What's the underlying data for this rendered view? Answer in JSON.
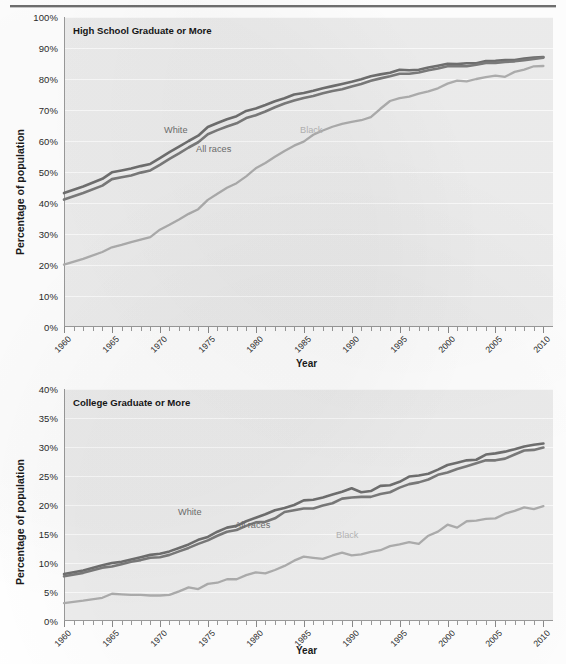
{
  "figure": {
    "shared_xlabel": "Year",
    "shared_ylabel": "Percentage of population"
  },
  "chart_data": [
    {
      "type": "line",
      "title": "High School Graduate or More",
      "xlabel": "Year",
      "ylabel": "Percentage of population",
      "xlim": [
        1960,
        2011
      ],
      "ylim": [
        0,
        100
      ],
      "ytick_labels": [
        "0%",
        "10%",
        "20%",
        "30%",
        "40%",
        "50%",
        "60%",
        "70%",
        "80%",
        "90%",
        "100%"
      ],
      "ytick_values": [
        0,
        10,
        20,
        30,
        40,
        50,
        60,
        70,
        80,
        90,
        100
      ],
      "xtick_labels": [
        "1960",
        "1965",
        "1970",
        "1975",
        "1980",
        "1985",
        "1990",
        "1995",
        "2000",
        "2005",
        "2010"
      ],
      "xtick_values": [
        1960,
        1965,
        1970,
        1975,
        1980,
        1985,
        1990,
        1995,
        2000,
        2005,
        2010
      ],
      "grid": "horizontal",
      "legend": "inline-annotations",
      "annotations": [
        {
          "text": "White",
          "series": "White"
        },
        {
          "text": "All races",
          "series": "All races"
        },
        {
          "text": "Black",
          "series": "Black"
        }
      ],
      "x": [
        1960,
        1962,
        1964,
        1965,
        1966,
        1967,
        1968,
        1969,
        1970,
        1971,
        1972,
        1973,
        1974,
        1975,
        1976,
        1977,
        1978,
        1979,
        1980,
        1981,
        1982,
        1983,
        1984,
        1985,
        1986,
        1987,
        1988,
        1989,
        1990,
        1991,
        1992,
        1993,
        1994,
        1995,
        1996,
        1997,
        1998,
        1999,
        2000,
        2001,
        2002,
        2003,
        2004,
        2005,
        2006,
        2007,
        2008,
        2009,
        2010
      ],
      "series": [
        {
          "name": "White",
          "color": "#6f6f6f",
          "values": [
            43.2,
            45.3,
            47.8,
            49.9,
            50.5,
            51.1,
            51.9,
            52.6,
            54.5,
            56.4,
            58.2,
            60.0,
            61.7,
            64.5,
            65.8,
            67.0,
            68.0,
            69.7,
            70.5,
            71.6,
            72.8,
            73.8,
            75.0,
            75.5,
            76.2,
            77.0,
            77.7,
            78.4,
            79.1,
            79.9,
            80.9,
            81.5,
            82.0,
            83.0,
            82.8,
            83.0,
            83.7,
            84.3,
            84.9,
            84.8,
            85.1,
            85.1,
            85.8,
            85.9,
            86.1,
            86.1,
            86.6,
            86.9,
            87.1
          ]
        },
        {
          "name": "All races",
          "color": "#7a7a7a",
          "values": [
            41.1,
            43.2,
            45.6,
            47.7,
            48.3,
            48.9,
            49.8,
            50.5,
            52.3,
            54.2,
            56.0,
            57.9,
            59.6,
            62.2,
            63.5,
            64.7,
            65.7,
            67.4,
            68.3,
            69.5,
            70.9,
            72.1,
            73.1,
            73.9,
            74.5,
            75.4,
            76.1,
            76.7,
            77.6,
            78.4,
            79.4,
            80.2,
            80.9,
            81.7,
            81.7,
            82.1,
            82.8,
            83.4,
            84.1,
            84.1,
            84.1,
            84.6,
            85.2,
            85.2,
            85.5,
            85.7,
            86.1,
            86.5,
            86.9
          ]
        },
        {
          "name": "Black",
          "color": "#adadad",
          "values": [
            20.1,
            22.0,
            24.2,
            25.7,
            26.5,
            27.4,
            28.2,
            29.0,
            31.4,
            33.0,
            34.7,
            36.5,
            38.0,
            41.0,
            43.0,
            44.9,
            46.4,
            48.6,
            51.2,
            52.9,
            54.9,
            56.8,
            58.5,
            59.8,
            62.0,
            63.4,
            64.6,
            65.5,
            66.2,
            66.7,
            67.7,
            70.4,
            72.9,
            73.8,
            74.3,
            75.3,
            76.0,
            77.0,
            78.5,
            79.5,
            79.2,
            80.0,
            80.6,
            81.1,
            80.7,
            82.3,
            83.0,
            84.1,
            84.2
          ]
        }
      ]
    },
    {
      "type": "line",
      "title": "College Graduate or More",
      "xlabel": "Year",
      "ylabel": "Percentage of population",
      "xlim": [
        1960,
        2011
      ],
      "ylim": [
        0,
        40
      ],
      "ytick_labels": [
        "0%",
        "5%",
        "10%",
        "15%",
        "20%",
        "25%",
        "30%",
        "35%",
        "40%"
      ],
      "ytick_values": [
        0,
        5,
        10,
        15,
        20,
        25,
        30,
        35,
        40
      ],
      "xtick_labels": [
        "1960",
        "1965",
        "1970",
        "1975",
        "1980",
        "1985",
        "1990",
        "1995",
        "2000",
        "2005",
        "2010"
      ],
      "xtick_values": [
        1960,
        1965,
        1970,
        1975,
        1980,
        1985,
        1990,
        1995,
        2000,
        2005,
        2010
      ],
      "grid": "horizontal",
      "legend": "inline-annotations",
      "annotations": [
        {
          "text": "White",
          "series": "White"
        },
        {
          "text": "All races",
          "series": "All races"
        },
        {
          "text": "Black",
          "series": "Black"
        }
      ],
      "x": [
        1960,
        1962,
        1964,
        1965,
        1966,
        1967,
        1968,
        1969,
        1970,
        1971,
        1972,
        1973,
        1974,
        1975,
        1976,
        1977,
        1978,
        1979,
        1980,
        1981,
        1982,
        1983,
        1984,
        1985,
        1986,
        1987,
        1988,
        1989,
        1990,
        1991,
        1992,
        1993,
        1994,
        1995,
        1996,
        1997,
        1998,
        1999,
        2000,
        2001,
        2002,
        2003,
        2004,
        2005,
        2006,
        2007,
        2008,
        2009,
        2010
      ],
      "series": [
        {
          "name": "White",
          "color": "#6f6f6f",
          "values": [
            8.1,
            8.7,
            9.6,
            10.0,
            10.2,
            10.6,
            11.0,
            11.4,
            11.6,
            12.0,
            12.6,
            13.2,
            14.0,
            14.5,
            15.4,
            16.1,
            16.4,
            17.2,
            17.8,
            18.4,
            19.1,
            19.5,
            20.0,
            20.8,
            20.9,
            21.3,
            21.8,
            22.3,
            22.9,
            22.2,
            22.4,
            23.3,
            23.4,
            24.0,
            24.9,
            25.1,
            25.4,
            26.1,
            26.9,
            27.3,
            27.7,
            27.8,
            28.7,
            28.9,
            29.2,
            29.6,
            30.1,
            30.4,
            30.6
          ]
        },
        {
          "name": "All races",
          "color": "#7a7a7a",
          "values": [
            7.7,
            8.3,
            9.2,
            9.4,
            9.8,
            10.2,
            10.5,
            10.9,
            11.0,
            11.4,
            12.0,
            12.6,
            13.3,
            13.9,
            14.7,
            15.4,
            15.7,
            16.4,
            17.0,
            17.1,
            17.7,
            18.8,
            19.1,
            19.4,
            19.4,
            19.9,
            20.3,
            21.1,
            21.3,
            21.4,
            21.4,
            21.9,
            22.2,
            23.0,
            23.6,
            23.9,
            24.4,
            25.2,
            25.6,
            26.2,
            26.7,
            27.2,
            27.7,
            27.7,
            28.0,
            28.7,
            29.4,
            29.5,
            29.9
          ]
        },
        {
          "name": "Black",
          "color": "#adadad",
          "values": [
            3.1,
            3.5,
            4.0,
            4.7,
            4.6,
            4.5,
            4.5,
            4.4,
            4.4,
            4.5,
            5.1,
            5.8,
            5.5,
            6.4,
            6.6,
            7.2,
            7.2,
            7.9,
            8.4,
            8.2,
            8.8,
            9.5,
            10.4,
            11.1,
            10.9,
            10.7,
            11.3,
            11.8,
            11.3,
            11.5,
            11.9,
            12.2,
            12.9,
            13.2,
            13.6,
            13.3,
            14.7,
            15.4,
            16.6,
            16.1,
            17.2,
            17.3,
            17.6,
            17.7,
            18.5,
            19.0,
            19.6,
            19.3,
            19.8
          ]
        }
      ]
    }
  ]
}
